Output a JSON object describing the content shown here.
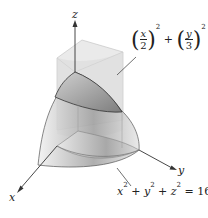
{
  "axes": {
    "x_label": "x",
    "y_label": "y",
    "z_label": "z"
  },
  "cylinder_equation": {
    "x_num": "x",
    "x_den": "2",
    "y_num": "y",
    "y_den": "3",
    "exp": "2",
    "plus": "+",
    "rhs": "= 1"
  },
  "sphere_equation": {
    "x": "x",
    "y": "y",
    "z": "z",
    "exp": "2",
    "plus": "+",
    "rhs": "= 16"
  },
  "colors": {
    "line": "#333333",
    "surface_dark": "#8a8a8a",
    "surface_light": "#e6e6e6",
    "cylinder": "#d9d9d9"
  }
}
